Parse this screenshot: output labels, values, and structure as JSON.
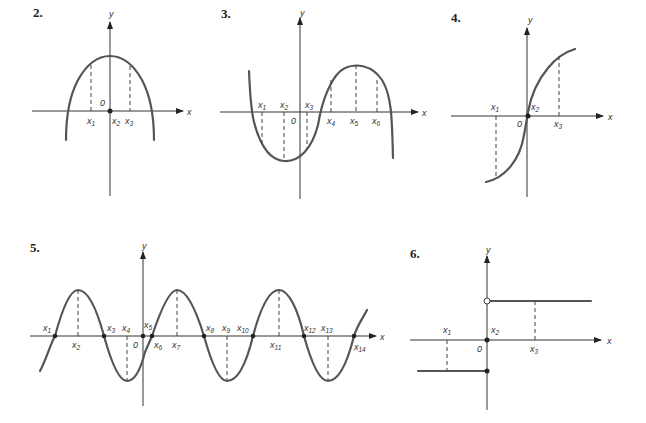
{
  "figure": {
    "graphs": [
      {
        "number": "2.",
        "axis_x": "x",
        "axis_y": "y",
        "origin": "0",
        "points": [
          "x1",
          "x2",
          "x3"
        ],
        "labels": [
          {
            "base": "x",
            "sub": "1"
          },
          {
            "base": "x",
            "sub": "2"
          },
          {
            "base": "x",
            "sub": "3"
          }
        ],
        "shape": "downward parabola, max at x2 on y-axis"
      },
      {
        "number": "3.",
        "axis_x": "x",
        "axis_y": "y",
        "origin": "0",
        "labels": [
          {
            "base": "x",
            "sub": "1"
          },
          {
            "base": "x",
            "sub": "2"
          },
          {
            "base": "x",
            "sub": "3"
          },
          {
            "base": "x",
            "sub": "4"
          },
          {
            "base": "x",
            "sub": "5"
          },
          {
            "base": "x",
            "sub": "6"
          }
        ],
        "shape": "cubic-like curve: min at x2, max at x5"
      },
      {
        "number": "4.",
        "axis_x": "x",
        "axis_y": "y",
        "origin": "0",
        "labels": [
          {
            "base": "x",
            "sub": "1"
          },
          {
            "base": "x",
            "sub": "2"
          },
          {
            "base": "x",
            "sub": "3"
          }
        ],
        "shape": "increasing S-curve through origin, vertical tangent at x2"
      },
      {
        "number": "5.",
        "axis_x": "x",
        "axis_y": "y",
        "origin": "0",
        "labels": [
          {
            "base": "x",
            "sub": "1"
          },
          {
            "base": "x",
            "sub": "2"
          },
          {
            "base": "x",
            "sub": "3"
          },
          {
            "base": "x",
            "sub": "4"
          },
          {
            "base": "x",
            "sub": "5"
          },
          {
            "base": "x",
            "sub": "6"
          },
          {
            "base": "x",
            "sub": "7"
          },
          {
            "base": "x",
            "sub": "8"
          },
          {
            "base": "x",
            "sub": "9"
          },
          {
            "base": "x",
            "sub": "10"
          },
          {
            "base": "x",
            "sub": "11"
          },
          {
            "base": "x",
            "sub": "12"
          },
          {
            "base": "x",
            "sub": "13"
          },
          {
            "base": "x",
            "sub": "14"
          }
        ],
        "shape": "sinusoid: peaks at x2, x7, x11; troughs at x4, x9, x13"
      },
      {
        "number": "6.",
        "axis_x": "x",
        "axis_y": "y",
        "origin": "0",
        "labels": [
          {
            "base": "x",
            "sub": "1"
          },
          {
            "base": "x",
            "sub": "2"
          },
          {
            "base": "x",
            "sub": "3"
          }
        ],
        "shape": "step function: negative constant for x<=0 (closed dot), positive constant for x>0 (open circle)"
      }
    ]
  }
}
